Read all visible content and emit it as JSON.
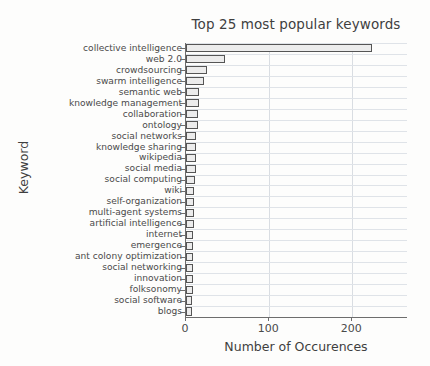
{
  "chart_data": {
    "type": "bar",
    "orientation": "horizontal",
    "title": "Top 25 most popular keywords",
    "xlabel": "Number of Occurences",
    "ylabel": "Keyword",
    "xlim": [
      0,
      267
    ],
    "xticks": [
      0,
      100,
      200
    ],
    "xticklabels": [
      "0",
      "100",
      "200"
    ],
    "grid": "vertical-and-horizontal",
    "legend": "none",
    "bar_fill_color": "#ececec",
    "bar_edge_color": "#555555",
    "categories": [
      "collective intelligence",
      "web 2.0",
      "crowdsourcing",
      "swarm intelligence",
      "semantic web",
      "knowledge management",
      "collaboration",
      "ontology",
      "social networks",
      "knowledge sharing",
      "wikipedia",
      "social media",
      "social computing",
      "wiki",
      "self-organization",
      "multi-agent systems",
      "artificial intelligence",
      "internet",
      "emergence",
      "ant colony optimization",
      "social networking",
      "innovation",
      "folksonomy",
      "social software",
      "blogs"
    ],
    "values": [
      224,
      47,
      25,
      22,
      16,
      16,
      15,
      14,
      12,
      12,
      12,
      12,
      11,
      10,
      10,
      10,
      10,
      9,
      9,
      9,
      8,
      8,
      8,
      7,
      7
    ]
  }
}
